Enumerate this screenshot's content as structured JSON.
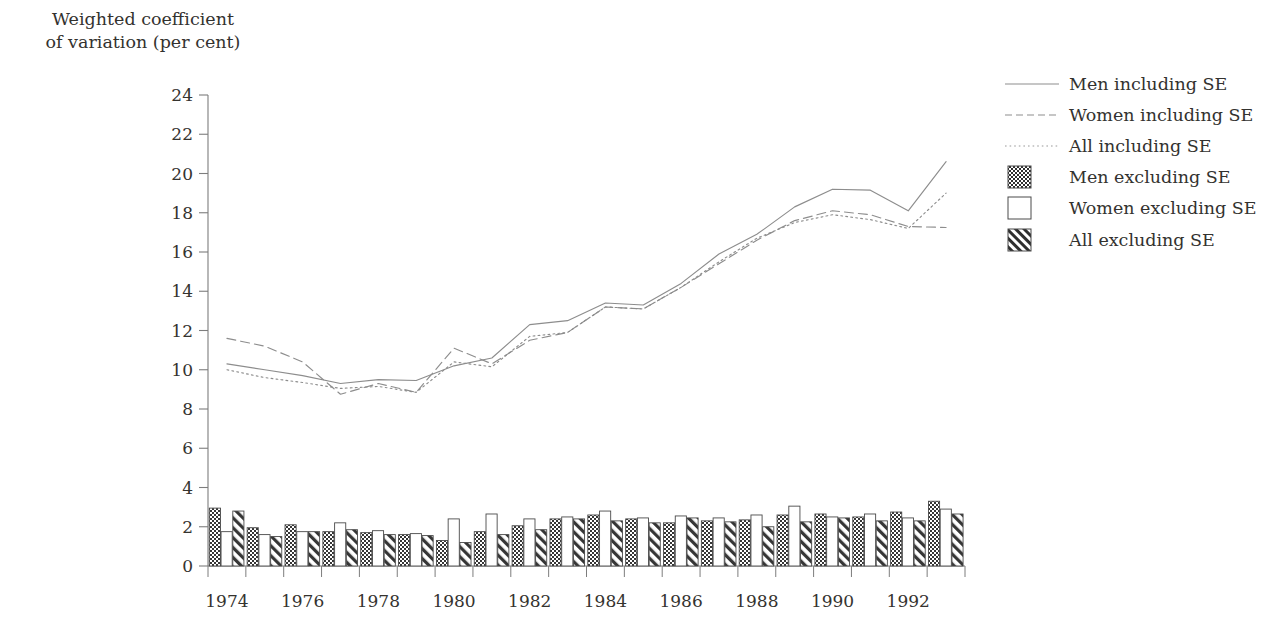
{
  "chart_data": {
    "type": "bar",
    "title": "",
    "ylabel": "Weighted coefficient\nof variation (per cent)",
    "xlabel": "",
    "ylim": [
      0,
      24
    ],
    "ytick_step": 2,
    "yticks": [
      0,
      2,
      4,
      6,
      8,
      10,
      12,
      14,
      16,
      18,
      20,
      22,
      24
    ],
    "grid": false,
    "legend_position": "right",
    "x": [
      1974,
      1975,
      1976,
      1977,
      1978,
      1979,
      1980,
      1981,
      1982,
      1983,
      1984,
      1985,
      1986,
      1987,
      1988,
      1989,
      1990,
      1991,
      1992,
      1993
    ],
    "xtick_labels": [
      "1974",
      "1976",
      "1978",
      "1980",
      "1982",
      "1984",
      "1986",
      "1988",
      "1990",
      "1992"
    ],
    "xtick_values": [
      1974,
      1976,
      1978,
      1980,
      1982,
      1984,
      1986,
      1988,
      1990,
      1992
    ],
    "bar_series": [
      {
        "name": "Men excluding SE",
        "pattern": "checkerboard",
        "values": [
          2.95,
          1.95,
          2.1,
          1.75,
          1.7,
          1.6,
          1.3,
          1.75,
          2.05,
          2.4,
          2.6,
          2.4,
          2.2,
          2.3,
          2.35,
          2.6,
          2.65,
          2.5,
          2.75,
          3.3
        ]
      },
      {
        "name": "Women excluding SE",
        "pattern": "white",
        "values": [
          1.75,
          1.6,
          1.75,
          2.2,
          1.8,
          1.65,
          2.4,
          2.65,
          2.4,
          2.5,
          2.8,
          2.45,
          2.55,
          2.45,
          2.6,
          3.05,
          2.5,
          2.65,
          2.45,
          2.9
        ]
      },
      {
        "name": "All excluding SE",
        "pattern": "diagonal",
        "values": [
          2.8,
          1.5,
          1.75,
          1.85,
          1.6,
          1.55,
          1.2,
          1.6,
          1.85,
          2.4,
          2.3,
          2.2,
          2.45,
          2.25,
          2.0,
          2.25,
          2.45,
          2.3,
          2.3,
          2.65
        ]
      }
    ],
    "line_series": [
      {
        "name": "Men including SE",
        "style": "solid",
        "values": [
          10.3,
          10.0,
          9.7,
          9.3,
          9.5,
          9.45,
          10.2,
          10.6,
          12.3,
          12.5,
          13.4,
          13.3,
          14.4,
          15.9,
          16.9,
          18.3,
          19.2,
          19.15,
          18.1,
          20.6
        ]
      },
      {
        "name": "Women including SE",
        "style": "dashed",
        "values": [
          11.6,
          11.2,
          10.4,
          8.75,
          9.3,
          8.85,
          11.1,
          10.3,
          11.5,
          11.9,
          13.2,
          13.1,
          14.2,
          15.4,
          16.6,
          17.6,
          18.1,
          17.9,
          17.3,
          17.25
        ]
      },
      {
        "name": "All including SE",
        "style": "dotted",
        "values": [
          10.0,
          9.6,
          9.35,
          9.05,
          9.15,
          8.85,
          10.4,
          10.15,
          11.7,
          11.9,
          13.2,
          13.1,
          14.2,
          15.5,
          16.7,
          17.5,
          17.9,
          17.65,
          17.2,
          19.0
        ]
      }
    ]
  },
  "legend": {
    "items": [
      {
        "label": "Men including SE",
        "key": "line-solid"
      },
      {
        "label": "Women including SE",
        "key": "line-dashed"
      },
      {
        "label": "All including SE",
        "key": "line-dotted"
      },
      {
        "label": "Men excluding SE",
        "key": "swatch-checkerboard"
      },
      {
        "label": "Women excluding SE",
        "key": "swatch-white"
      },
      {
        "label": "All excluding SE",
        "key": "swatch-diagonal"
      }
    ]
  },
  "colors": {
    "ink": "#3a3a3a",
    "axis": "#7d7d7d",
    "line_light": "#8d8d8d",
    "bar_outline": "#4a4a4a",
    "background": "#ffffff"
  }
}
